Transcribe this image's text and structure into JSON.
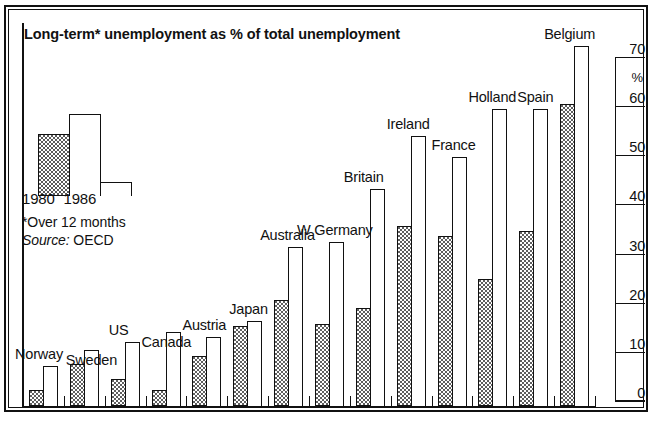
{
  "title": "Long-term* unemployment as % of total unemployment",
  "legend": {
    "label_1980": "1980",
    "label_1986": "1986",
    "key_1980_name": "shaded-bar-1980",
    "key_1986_name": "outline-bar-1986"
  },
  "footnote": {
    "line1": "*Over 12 months",
    "source_label": "Source:",
    "source_value": "OECD"
  },
  "axis": {
    "unit": "%",
    "ticks": [
      "70",
      "60",
      "50",
      "40",
      "30",
      "20",
      "10",
      "0"
    ]
  },
  "chart_data": {
    "type": "bar",
    "title": "Long-term* unemployment as % of total unemployment",
    "xlabel": "",
    "ylabel": "%",
    "ylim": [
      0,
      70
    ],
    "yticks": [
      0,
      10,
      20,
      30,
      40,
      50,
      60,
      70
    ],
    "grid": false,
    "legend_position": "inside-left",
    "note": "*Over 12 months",
    "source": "OECD",
    "categories": [
      "Norway",
      "Sweden",
      "US",
      "Canada",
      "Austria",
      "Japan",
      "Australia",
      "W Germany",
      "Britain",
      "Ireland",
      "France",
      "Holland",
      "Spain",
      "Belgium"
    ],
    "series": [
      {
        "name": "1980",
        "style": "shaded",
        "values": [
          3,
          8,
          5,
          3,
          9.5,
          15,
          20,
          15.5,
          18.5,
          34,
          32,
          24,
          33,
          57
        ]
      },
      {
        "name": "1986",
        "style": "outline",
        "values": [
          7.5,
          10.5,
          12,
          14,
          13,
          16,
          30,
          31,
          41,
          51,
          47,
          56,
          56,
          68
        ]
      }
    ]
  }
}
